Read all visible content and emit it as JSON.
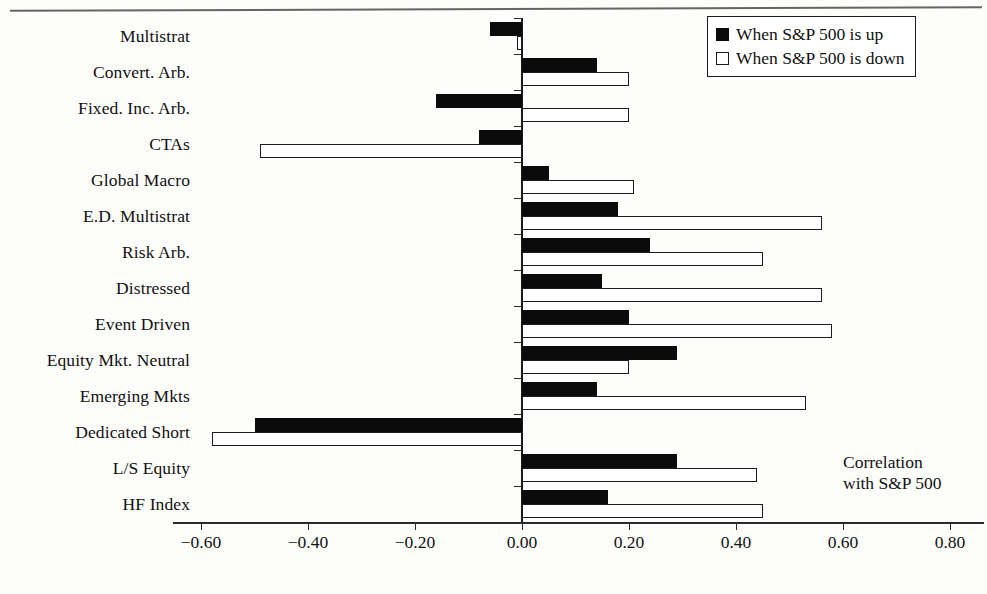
{
  "chart_data": {
    "type": "bar",
    "orientation": "horizontal",
    "title": "",
    "xlabel": "",
    "ylabel": "",
    "xlim": [
      -0.7,
      0.85
    ],
    "grid": false,
    "annotation": "Correlation\nwith S&P 500",
    "annotation_lines": [
      "Correlation",
      "with S&P 500"
    ],
    "legend_position": "top-right",
    "xticks": [
      -0.6,
      -0.4,
      -0.2,
      0.0,
      0.2,
      0.4,
      0.6,
      0.8
    ],
    "xticklabels": [
      "−0.60",
      "−0.40",
      "−0.20",
      "0.00",
      "0.20",
      "0.40",
      "0.60",
      "0.80"
    ],
    "categories": [
      "Multistrat",
      "Convert. Arb.",
      "Fixed. Inc. Arb.",
      "CTAs",
      "Global Macro",
      "E.D. Multistrat",
      "Risk Arb.",
      "Distressed",
      "Event Driven",
      "Equity Mkt. Neutral",
      "Emerging Mkts",
      "Dedicated Short",
      "L/S Equity",
      "HF Index"
    ],
    "series": [
      {
        "name": "When S&P 500 is up",
        "style": "filled-black",
        "color": "#0b0b0b",
        "values": [
          -0.06,
          0.14,
          -0.16,
          -0.08,
          0.05,
          0.18,
          0.24,
          0.15,
          0.2,
          0.29,
          0.14,
          -0.5,
          0.29,
          0.16
        ]
      },
      {
        "name": "When S&P 500 is down",
        "style": "open-white",
        "color": "#ffffff",
        "edgecolor": "#1b1b1b",
        "values": [
          -0.01,
          0.2,
          0.2,
          -0.49,
          0.21,
          0.56,
          0.45,
          0.56,
          0.58,
          0.2,
          0.53,
          -0.58,
          0.44,
          0.45
        ]
      }
    ]
  },
  "legend": {
    "items": [
      {
        "label": "When S&P 500 is up",
        "swatch": "filled-black"
      },
      {
        "label": "When S&P 500 is down",
        "swatch": "open-white"
      }
    ]
  }
}
